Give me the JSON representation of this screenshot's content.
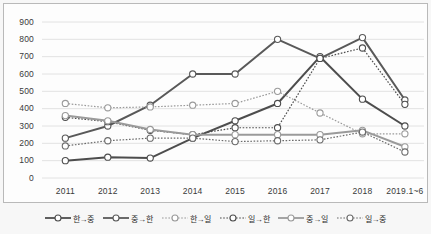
{
  "chart_data": {
    "type": "line",
    "title": "",
    "xlabel": "",
    "ylabel": "",
    "ylim": [
      0,
      900
    ],
    "yticks": [
      900,
      800,
      700,
      600,
      500,
      400,
      300,
      200,
      100,
      0
    ],
    "grid": true,
    "legend_position": "bottom",
    "categories": [
      "2011",
      "2012",
      "2013",
      "2014",
      "2015",
      "2016",
      "2017",
      "2018",
      "2019.1~6"
    ],
    "series": [
      {
        "name": "한→중",
        "style": "solid",
        "color": "#4d4d4d",
        "values": [
          100,
          120,
          115,
          230,
          330,
          430,
          700,
          455,
          300
        ]
      },
      {
        "name": "중→한",
        "style": "solid",
        "color": "#595959",
        "values": [
          230,
          300,
          420,
          600,
          600,
          800,
          690,
          810,
          450
        ]
      },
      {
        "name": "한→일",
        "style": "dotted",
        "color": "#9a9a9a",
        "values": [
          430,
          405,
          410,
          420,
          430,
          500,
          375,
          255,
          255
        ]
      },
      {
        "name": "일→한",
        "style": "dotted",
        "color": "#4d4d4d",
        "values": [
          350,
          325,
          275,
          250,
          290,
          290,
          690,
          750,
          425
        ]
      },
      {
        "name": "중→일",
        "style": "solid",
        "color": "#9a9a9a",
        "values": [
          360,
          330,
          280,
          250,
          250,
          250,
          250,
          275,
          180
        ]
      },
      {
        "name": "일→중",
        "style": "dotted",
        "color": "#6b6b6b",
        "values": [
          185,
          215,
          230,
          230,
          210,
          215,
          220,
          265,
          150
        ]
      }
    ]
  },
  "legend": {
    "items": [
      {
        "label": "한→중"
      },
      {
        "label": "중→한"
      },
      {
        "label": "한→일"
      },
      {
        "label": "일→한"
      },
      {
        "label": "중→일"
      },
      {
        "label": "일→중"
      }
    ]
  }
}
